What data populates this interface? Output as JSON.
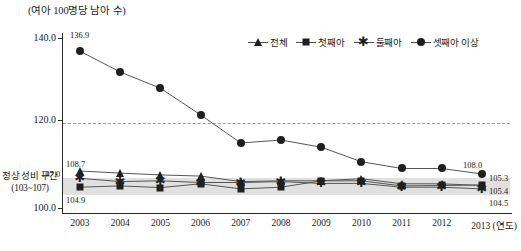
{
  "chart_data": {
    "type": "line",
    "title": "(여아 100명당 남아 수)",
    "xlabel": "(연도)",
    "ylabel": "(여아 100명당 남아 수)",
    "categories": [
      "2003",
      "2004",
      "2005",
      "2006",
      "2007",
      "2008",
      "2009",
      "2010",
      "2011",
      "2012",
      "2013"
    ],
    "ylim": [
      100.0,
      140.0
    ],
    "yticks": [
      "140.0",
      "120.0",
      "100.0"
    ],
    "ytick_values": [
      140.0,
      120.0,
      100.0
    ],
    "grid": "dashed gridline at 120.0",
    "legend_position": "top-right",
    "series": [
      {
        "name": "전체",
        "marker": "triangle",
        "values": [
          108.7,
          108.2,
          107.8,
          107.5,
          106.2,
          106.4,
          106.4,
          106.9,
          105.7,
          105.7,
          105.3
        ],
        "labels": {
          "2003": "108.7",
          "2013": "105.3"
        }
      },
      {
        "name": "첫째아",
        "marker": "square",
        "values": [
          104.9,
          105.2,
          104.8,
          105.7,
          104.5,
          104.9,
          106.4,
          106.4,
          105.2,
          105.3,
          105.4
        ],
        "labels": {
          "2003": "104.9",
          "2013": "105.4"
        }
      },
      {
        "name": "둘째아",
        "marker": "star",
        "values": [
          107.0,
          106.2,
          106.4,
          106.0,
          106.0,
          106.2,
          105.8,
          105.8,
          104.9,
          104.9,
          104.5
        ],
        "labels": {
          "2003": "107.0",
          "2013": "104.5"
        }
      },
      {
        "name": "셋째아 이상",
        "marker": "circle",
        "values": [
          136.9,
          132.0,
          128.2,
          121.9,
          115.3,
          116.0,
          114.3,
          110.9,
          109.3,
          109.3,
          108.0
        ],
        "labels": {
          "2003": "136.9",
          "2013": "108.0"
        }
      }
    ],
    "band": {
      "label_line1": "정상 성비 구간",
      "label_line2": "(103~107)",
      "range": [
        103,
        107
      ],
      "color": "#d6d6d6"
    },
    "annotations": {
      "left_first_labels": [
        "108.7",
        "107.0",
        "104.9"
      ],
      "right_last_labels": [
        "108.0",
        "105.3",
        "105.4",
        "104.5"
      ],
      "first_point_label": "136.9"
    }
  },
  "legend": {
    "items": [
      {
        "label": "전체",
        "marker": "triangle-marker"
      },
      {
        "label": "첫째아",
        "marker": "square-marker"
      },
      {
        "label": "둘째아",
        "marker": "star-marker"
      },
      {
        "label": "셋째아 이상",
        "marker": "circle-marker"
      }
    ]
  },
  "axes": {
    "y_title": "(여아 100명당 남아 수)",
    "y_tick_140": "140.0",
    "y_tick_120": "120.0",
    "y_tick_100": "100.0",
    "x_unit_label": "(연도)",
    "x_last_with_unit": "2013 (연도)"
  },
  "labels": {
    "p_2003_total": "108.7",
    "p_2003_second": "107.0",
    "p_2003_first": "104.9",
    "p_2003_third": "136.9",
    "p_2013_third": "108.0",
    "p_2013_total": "105.3",
    "p_2013_first": "105.4",
    "p_2013_second": "104.5"
  },
  "caption": ""
}
